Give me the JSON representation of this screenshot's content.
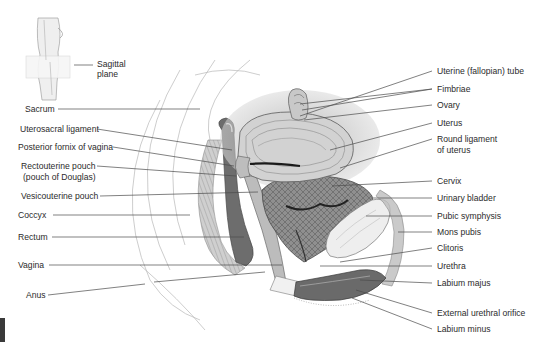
{
  "figure": {
    "inset": {
      "label_line1": "Sagittal",
      "label_line2": "plane"
    },
    "labels_left": [
      {
        "id": "sacrum",
        "text": "Sacrum"
      },
      {
        "id": "uterosacral-ligament",
        "text": "Uterosacral ligament"
      },
      {
        "id": "posterior-fornix",
        "text": "Posterior fornix of vagina"
      },
      {
        "id": "rectouterine-pouch-1",
        "text": "Rectouterine pouch"
      },
      {
        "id": "rectouterine-pouch-2",
        "text": "(pouch of Douglas)"
      },
      {
        "id": "vesicouterine-pouch",
        "text": "Vesicouterine pouch"
      },
      {
        "id": "coccyx",
        "text": "Coccyx"
      },
      {
        "id": "rectum",
        "text": "Rectum"
      },
      {
        "id": "vagina",
        "text": "Vagina"
      },
      {
        "id": "anus",
        "text": "Anus"
      }
    ],
    "labels_right": [
      {
        "id": "uterine-tube",
        "text": "Uterine (fallopian) tube"
      },
      {
        "id": "fimbriae",
        "text": "Fimbriae"
      },
      {
        "id": "ovary",
        "text": "Ovary"
      },
      {
        "id": "uterus",
        "text": "Uterus"
      },
      {
        "id": "round-ligament-1",
        "text": "Round ligament"
      },
      {
        "id": "round-ligament-2",
        "text": "of uterus"
      },
      {
        "id": "cervix",
        "text": "Cervix"
      },
      {
        "id": "urinary-bladder",
        "text": "Urinary bladder"
      },
      {
        "id": "pubic-symphysis",
        "text": "Pubic symphysis"
      },
      {
        "id": "mons-pubis",
        "text": "Mons pubis"
      },
      {
        "id": "clitoris",
        "text": "Clitoris"
      },
      {
        "id": "urethra",
        "text": "Urethra"
      },
      {
        "id": "labium-majus",
        "text": "Labium majus"
      },
      {
        "id": "external-urethral-orifice",
        "text": "External urethral orifice"
      },
      {
        "id": "labium-minus",
        "text": "Labium minus"
      }
    ],
    "colors": {
      "text": "#2b2b2b",
      "leader": "#4a4a4a",
      "tissue_dark": "#5a5a5a",
      "tissue_mid": "#9a9a9a",
      "tissue_light": "#d6d6d6",
      "background": "#ffffff"
    }
  }
}
